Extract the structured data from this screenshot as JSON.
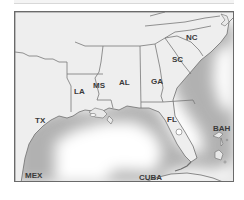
{
  "map": {
    "region": "Southeastern United States and Gulf of Mexico",
    "labels": {
      "tx": "TX",
      "la": "LA",
      "ms": "MS",
      "al": "AL",
      "ga": "GA",
      "sc": "SC",
      "nc": "NC",
      "fl": "FL",
      "bah": "BAH",
      "mex": "MEX",
      "cuba": "CUBA"
    },
    "colors": {
      "land": "#eeeeee",
      "border": "#777777",
      "frame": "#6a6a6a",
      "water": "#ffffff",
      "coastal_shadow": "#9a9a9a",
      "label": "#3a3a3a"
    }
  }
}
